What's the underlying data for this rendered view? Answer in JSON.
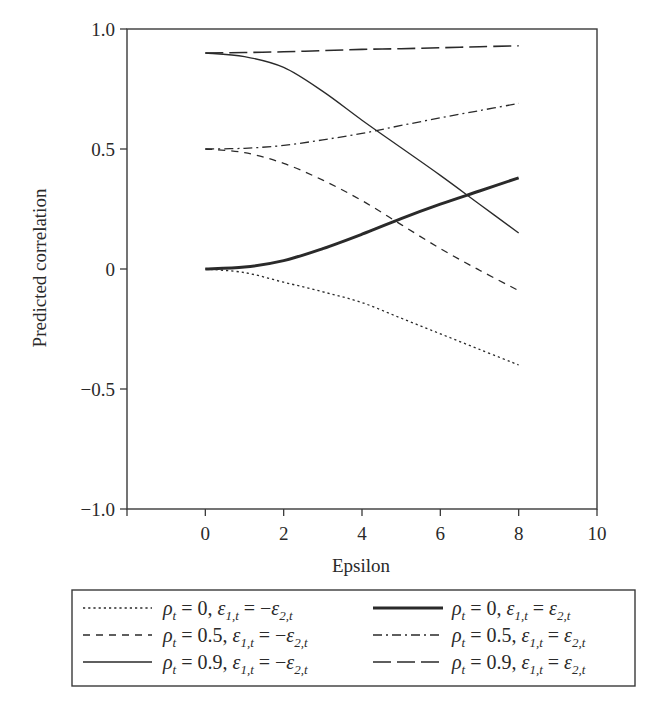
{
  "chart_data": {
    "type": "line",
    "title": "",
    "xlabel": "Epsilon",
    "ylabel": "Predicted correlation",
    "xlim": [
      -2,
      10
    ],
    "ylim": [
      -1.0,
      1.0
    ],
    "x_ticks": [
      0,
      2,
      4,
      6,
      8,
      10
    ],
    "x_tick_labels": [
      "0",
      "2",
      "4",
      "6",
      "8",
      "10"
    ],
    "y_ticks": [
      1.0,
      0.5,
      0,
      -0.5,
      -1.0
    ],
    "y_tick_labels": [
      "1.0",
      "0.5",
      "0",
      "−0.5",
      "−1.0"
    ],
    "grid": false,
    "legend_position": "bottom",
    "x": [
      0,
      1,
      2,
      3,
      4,
      5,
      6,
      7,
      8
    ],
    "series": [
      {
        "name": "ρt = 0, ε1,t = −ε2,t",
        "style": "dotted",
        "rho": "0",
        "relation": "−",
        "values": [
          0,
          -0.015,
          -0.055,
          -0.095,
          -0.14,
          -0.205,
          -0.27,
          -0.335,
          -0.4
        ]
      },
      {
        "name": "ρt = 0, ε1,t = ε2,t",
        "style": "thick-solid",
        "rho": "0",
        "relation": "",
        "values": [
          0,
          0.008,
          0.035,
          0.085,
          0.145,
          0.21,
          0.27,
          0.325,
          0.38
        ]
      },
      {
        "name": "ρt = 0.5, ε1,t = −ε2,t",
        "style": "dashed",
        "rho": "0.5",
        "relation": "−",
        "values": [
          0.5,
          0.485,
          0.44,
          0.37,
          0.285,
          0.185,
          0.085,
          -0.005,
          -0.09
        ]
      },
      {
        "name": "ρt = 0.5, ε1,t = ε2,t",
        "style": "dash-dot",
        "rho": "0.5",
        "relation": "",
        "values": [
          0.5,
          0.503,
          0.515,
          0.538,
          0.565,
          0.598,
          0.63,
          0.66,
          0.69
        ]
      },
      {
        "name": "ρt = 0.9, ε1,t = −ε2,t",
        "style": "thin-solid",
        "rho": "0.9",
        "relation": "−",
        "values": [
          0.9,
          0.885,
          0.84,
          0.74,
          0.62,
          0.505,
          0.39,
          0.27,
          0.15
        ]
      },
      {
        "name": "ρt = 0.9, ε1,t = ε2,t",
        "style": "long-dash",
        "rho": "0.9",
        "relation": "",
        "values": [
          0.9,
          0.902,
          0.905,
          0.91,
          0.915,
          0.918,
          0.922,
          0.926,
          0.93
        ]
      }
    ]
  },
  "axes": {
    "xlabel": "Epsilon",
    "ylabel": "Predicted correlation"
  },
  "legend": {
    "rows": [
      {
        "left": {
          "style": "dotted",
          "rho": "0",
          "relation": "−"
        },
        "right": {
          "style": "thick-solid",
          "rho": "0",
          "relation": ""
        }
      },
      {
        "left": {
          "style": "dashed",
          "rho": "0.5",
          "relation": "−"
        },
        "right": {
          "style": "dash-dot",
          "rho": "0.5",
          "relation": ""
        }
      },
      {
        "left": {
          "style": "thin-solid",
          "rho": "0.9",
          "relation": "−"
        },
        "right": {
          "style": "long-dash",
          "rho": "0.9",
          "relation": ""
        }
      }
    ]
  },
  "colors": {
    "line": "#2a2a2a",
    "frame": "#3a3a3a",
    "background": "#ffffff"
  }
}
